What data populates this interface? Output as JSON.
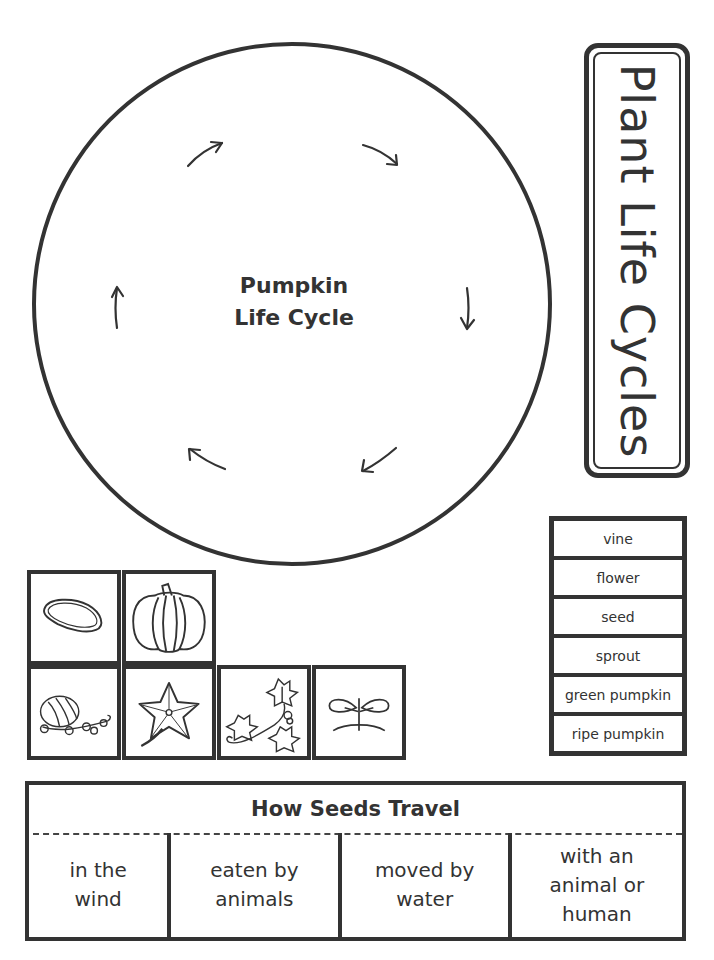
{
  "cycle": {
    "title_line1": "Pumpkin",
    "title_line2": "Life Cycle",
    "arrow_count": 6
  },
  "side_title": "Plant Life Cycles",
  "word_bank": [
    "vine",
    "flower",
    "seed",
    "sprout",
    "green pumpkin",
    "ripe pumpkin"
  ],
  "picture_cards": [
    {
      "icon": "pumpkin-seed-icon"
    },
    {
      "icon": "ripe-pumpkin-icon"
    },
    {
      "icon": "green-pumpkin-on-vine-icon"
    },
    {
      "icon": "flower-icon"
    },
    {
      "icon": "vine-icon"
    },
    {
      "icon": "sprout-icon"
    }
  ],
  "seeds_travel": {
    "title": "How Seeds Travel",
    "cells": [
      "in the wind",
      "eaten by animals",
      "moved by water",
      "with an animal or human"
    ]
  },
  "colors": {
    "ink": "#333333",
    "paper": "#ffffff"
  }
}
